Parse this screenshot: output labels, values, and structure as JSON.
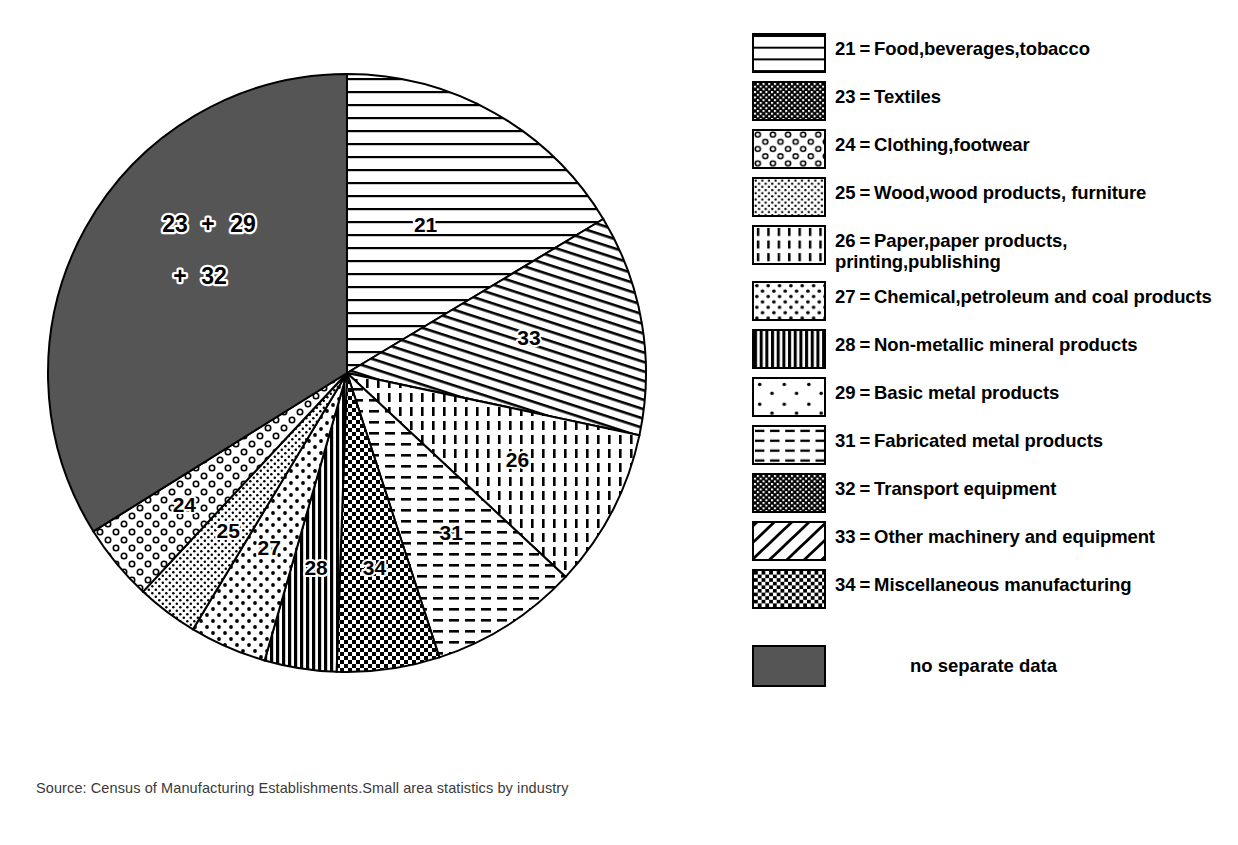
{
  "chart_data": {
    "type": "pie",
    "title": "",
    "source": "Source: Census of Manufacturing Establishments.Small area statistics by industry",
    "center": {
      "x": 347,
      "y": 373
    },
    "radius": 299,
    "legend_position": "right",
    "categories": [
      "21",
      "33",
      "26",
      "31",
      "34",
      "28",
      "27",
      "25",
      "24",
      "23+29+32"
    ],
    "labels": [
      "Food,beverages,tobacco",
      "Other machinery and equipment",
      "Paper,paper products,printing,publishing",
      "Fabricated metal products",
      "Miscellaneous manufacturing",
      "Non-metallic mineral products",
      "Chemical,petroleum and coal products",
      "Wood,wood products,furniture",
      "Clothing,footwear",
      "no separate data"
    ],
    "values": [
      16.4,
      11.9,
      8.6,
      8.1,
      5.6,
      3.9,
      4.2,
      3.3,
      4.2,
      33.8
    ],
    "slices": [
      {
        "code": "21",
        "start_deg": 0,
        "end_deg": 59,
        "pattern": "horizontal-lines",
        "label": "21",
        "label_r": 0.56,
        "label_deg": 28
      },
      {
        "code": "33",
        "start_deg": 59,
        "end_deg": 102,
        "pattern": "diagonal-lines-tight",
        "label": "33",
        "label_r": 0.62,
        "label_deg": 79
      },
      {
        "code": "26",
        "start_deg": 102,
        "end_deg": 133,
        "pattern": "vertical-dashes",
        "label": "26",
        "label_r": 0.64,
        "label_deg": 117
      },
      {
        "code": "31",
        "start_deg": 133,
        "end_deg": 162,
        "pattern": "horizontal-dashes",
        "label": "31",
        "label_r": 0.64,
        "label_deg": 147
      },
      {
        "code": "34",
        "start_deg": 162,
        "end_deg": 182,
        "pattern": "checker-fine",
        "label": "34",
        "label_r": 0.66,
        "label_deg": 172
      },
      {
        "code": "28",
        "start_deg": 182,
        "end_deg": 196,
        "pattern": "vertical-lines-dense",
        "label": "28",
        "label_r": 0.66,
        "label_deg": 189
      },
      {
        "code": "27",
        "start_deg": 196,
        "end_deg": 211,
        "pattern": "dots-medium",
        "label": "27",
        "label_r": 0.64,
        "label_deg": 204
      },
      {
        "code": "25",
        "start_deg": 211,
        "end_deg": 223,
        "pattern": "dots-fine",
        "label": "25",
        "label_r": 0.66,
        "label_deg": 217
      },
      {
        "code": "24",
        "start_deg": 223,
        "end_deg": 238,
        "pattern": "rings",
        "label": "24",
        "label_r": 0.7,
        "label_deg": 231
      },
      {
        "code": "23+29+32",
        "start_deg": 238,
        "end_deg": 360,
        "pattern": "solid-gray",
        "label": "",
        "label_r": 0.55,
        "label_deg": 300
      }
    ],
    "big_slice_label_line1": "23",
    "big_slice_label_plus1": "+",
    "big_slice_label_line1b": "29",
    "big_slice_label_plus2": "+",
    "big_slice_label_line2": "32",
    "gray_color": "#555555"
  },
  "legend": {
    "items": [
      {
        "code": "21",
        "eq": "=",
        "text": "Food,beverages,tobacco",
        "pattern": "horizontal-lines",
        "icon": "legend-swatch-icon"
      },
      {
        "code": "23",
        "eq": "=",
        "text": "Textiles",
        "pattern": "checker-dark",
        "icon": "legend-swatch-icon"
      },
      {
        "code": "24",
        "eq": "=",
        "text": "Clothing,footwear",
        "pattern": "rings",
        "icon": "legend-swatch-icon"
      },
      {
        "code": "25",
        "eq": "=",
        "text": "Wood,wood products, furniture",
        "pattern": "dots-fine",
        "icon": "legend-swatch-icon"
      },
      {
        "code": "26",
        "eq": "=",
        "text": "Paper,paper products, printing,publishing",
        "pattern": "vertical-dashes",
        "icon": "legend-swatch-icon"
      },
      {
        "code": "27",
        "eq": "=",
        "text": "Chemical,petroleum and coal products",
        "pattern": "dots-medium",
        "icon": "legend-swatch-icon"
      },
      {
        "code": "28",
        "eq": "=",
        "text": "Non-metallic mineral products",
        "pattern": "vertical-lines-dense",
        "icon": "legend-swatch-icon"
      },
      {
        "code": "29",
        "eq": "=",
        "text": "Basic metal products",
        "pattern": "dots-sparse",
        "icon": "legend-swatch-icon"
      },
      {
        "code": "31",
        "eq": "=",
        "text": "Fabricated metal products",
        "pattern": "horizontal-dashes",
        "icon": "legend-swatch-icon"
      },
      {
        "code": "32",
        "eq": "=",
        "text": "Transport  equipment",
        "pattern": "checker-dark",
        "icon": "legend-swatch-icon"
      },
      {
        "code": "33",
        "eq": "=",
        "text": "Other machinery and equipment",
        "pattern": "diagonal-lines-wide",
        "icon": "legend-swatch-icon"
      },
      {
        "code": "34",
        "eq": "=",
        "text": "Miscellaneous manufacturing",
        "pattern": "checker-fine",
        "icon": "legend-swatch-icon"
      }
    ],
    "no_separate_data_label": "no separate data"
  }
}
